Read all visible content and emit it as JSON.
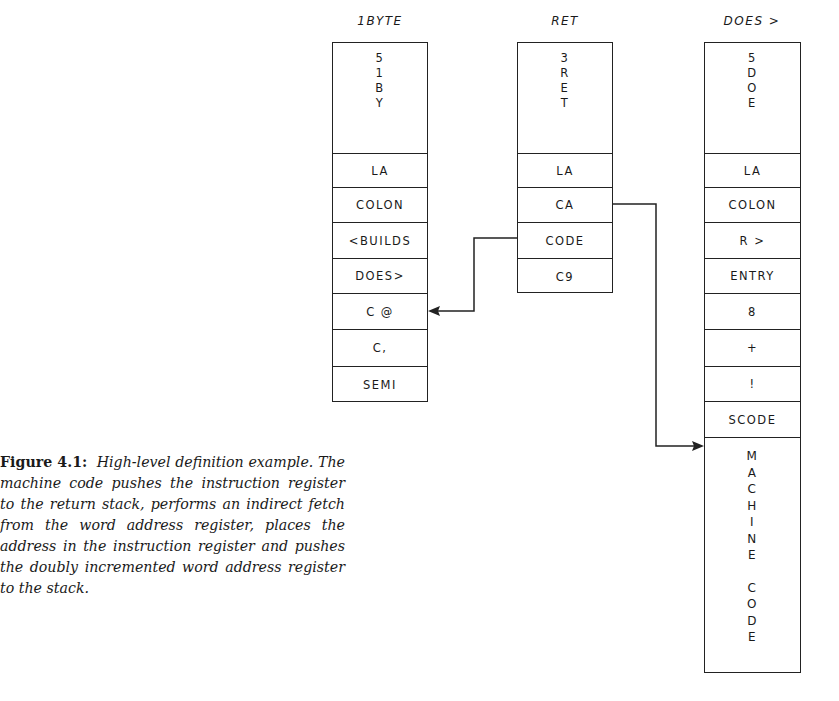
{
  "figure": {
    "columns": [
      {
        "id": "ibyte",
        "label": "1BYTE",
        "header_chars": [
          "5",
          "1",
          "B",
          "Y"
        ],
        "cells": [
          "LA",
          "COLON",
          "<BUILDS",
          "DOES>",
          "C @",
          "C,",
          "SEMI"
        ]
      },
      {
        "id": "ret",
        "label": "RET",
        "header_chars": [
          "3",
          "R",
          "E",
          "T"
        ],
        "cells": [
          "LA",
          "CA",
          "CODE",
          "C9"
        ]
      },
      {
        "id": "does",
        "label": "DOES >",
        "header_chars": [
          "5",
          "D",
          "O",
          "E"
        ],
        "cells": [
          "LA",
          "COLON",
          "R >",
          "ENTRY",
          "8",
          "+",
          "!",
          "SCODE"
        ],
        "tail_chars": [
          "M",
          "A",
          "C",
          "H",
          "I",
          "N",
          "E",
          " ",
          "C",
          "O",
          "D",
          "E"
        ]
      }
    ],
    "connectors": [
      {
        "from": "ret.CODE",
        "to": "ibyte.C @"
      },
      {
        "from": "ret.CA",
        "to": "does.MACHINE CODE"
      }
    ]
  },
  "caption": {
    "number": "Figure 4.1:",
    "text": "High-level definition example. The machine code pushes the instruction register to the return stack, performs an indirect fetch from the word address register, places the address in the instruction register and pushes the doubly incremented word address register to the stack."
  }
}
